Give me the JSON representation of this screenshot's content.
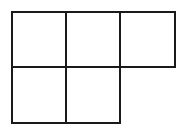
{
  "diagram": {
    "type": "grid-net",
    "line_color": "#1a1a1a",
    "background": "#ffffff",
    "rows": [
      {
        "row": 1,
        "cells": 3
      },
      {
        "row": 2,
        "cells": 2
      }
    ],
    "cells": [
      {
        "id": "r1c1",
        "row": 1,
        "col": 1,
        "x": 11,
        "y": 11,
        "w": 56,
        "h": 57,
        "label": ""
      },
      {
        "id": "r1c2",
        "row": 1,
        "col": 2,
        "x": 65,
        "y": 11,
        "w": 56,
        "h": 57,
        "label": ""
      },
      {
        "id": "r1c3",
        "row": 1,
        "col": 3,
        "x": 119,
        "y": 11,
        "w": 57,
        "h": 57,
        "label": ""
      },
      {
        "id": "r2c1",
        "row": 2,
        "col": 1,
        "x": 11,
        "y": 66,
        "w": 56,
        "h": 58,
        "label": ""
      },
      {
        "id": "r2c2",
        "row": 2,
        "col": 2,
        "x": 65,
        "y": 66,
        "w": 56,
        "h": 58,
        "label": ""
      }
    ]
  }
}
